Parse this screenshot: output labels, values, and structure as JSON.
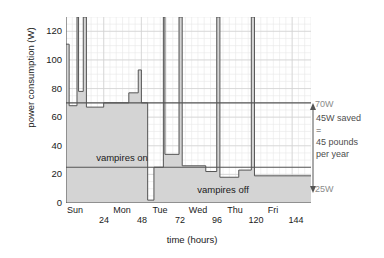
{
  "chart_data": {
    "type": "area",
    "title": "",
    "xlabel": "time (hours)",
    "ylabel": "power consumption (W)",
    "xlim": [
      0,
      156
    ],
    "ylim": [
      0,
      130
    ],
    "grid": true,
    "legend": "none",
    "yticks": [
      0,
      20,
      40,
      60,
      80,
      100,
      120
    ],
    "ytick_labels": [
      "0",
      "20",
      "40",
      "60",
      "80",
      "100",
      "120"
    ],
    "xticks": [
      0,
      24,
      48,
      72,
      96,
      120,
      144
    ],
    "xtick_labels": [
      "",
      "24",
      "48",
      "72",
      "96",
      "120",
      "144"
    ],
    "xtick_days": [
      {
        "label": "Sun",
        "x": 6
      },
      {
        "label": "Mon",
        "x": 36
      },
      {
        "label": "Tue",
        "x": 60
      },
      {
        "label": "Wed",
        "x": 84
      },
      {
        "label": "Thu",
        "x": 108
      },
      {
        "label": "Fri",
        "x": 132
      }
    ],
    "series": [
      {
        "name": "household power consumption",
        "fill_color": "#d4d4d4",
        "line_color": "#555555",
        "steps": [
          {
            "x0": 0,
            "x1": 2,
            "y": 111
          },
          {
            "x0": 2,
            "x1": 7,
            "y": 68
          },
          {
            "x0": 7,
            "x1": 8,
            "y": 130
          },
          {
            "x0": 8,
            "x1": 11,
            "y": 78
          },
          {
            "x0": 11,
            "x1": 13,
            "y": 130
          },
          {
            "x0": 13,
            "x1": 24,
            "y": 67
          },
          {
            "x0": 24,
            "x1": 40,
            "y": 70
          },
          {
            "x0": 40,
            "x1": 46,
            "y": 77
          },
          {
            "x0": 46,
            "x1": 48,
            "y": 93
          },
          {
            "x0": 48,
            "x1": 52,
            "y": 70
          },
          {
            "x0": 52,
            "x1": 56,
            "y": 2
          },
          {
            "x0": 56,
            "x1": 62,
            "y": 25
          },
          {
            "x0": 62,
            "x1": 63,
            "y": 130
          },
          {
            "x0": 63,
            "x1": 72,
            "y": 34
          },
          {
            "x0": 72,
            "x1": 74,
            "y": 130
          },
          {
            "x0": 74,
            "x1": 89,
            "y": 26
          },
          {
            "x0": 89,
            "x1": 96,
            "y": 22
          },
          {
            "x0": 96,
            "x1": 98,
            "y": 130
          },
          {
            "x0": 98,
            "x1": 110,
            "y": 18
          },
          {
            "x0": 110,
            "x1": 118,
            "y": 23
          },
          {
            "x0": 118,
            "x1": 120,
            "y": 130
          },
          {
            "x0": 120,
            "x1": 156,
            "y": 19
          }
        ]
      }
    ],
    "reference_lines": [
      {
        "name": "vampires-on-baseline",
        "value": 70,
        "label": "70W",
        "x0": 0,
        "x1": 156
      },
      {
        "name": "vampires-off-baseline",
        "value": 25,
        "label": "25W",
        "x0": 0,
        "x1": 156
      }
    ],
    "annotations": [
      {
        "name": "vampires-on",
        "text": "vampires on",
        "x": 36,
        "y": 43
      },
      {
        "name": "vampires-off",
        "text": "vampires off",
        "x": 100,
        "y": 12
      }
    ],
    "callout": {
      "top_label": "70W",
      "bottom_label": "25W",
      "lines": [
        "45W saved",
        "=",
        "45 pounds",
        "per year"
      ],
      "delta": 45
    }
  },
  "colors": {
    "fill": "#d4d4d4",
    "stroke": "#555555",
    "grid_minor": "#e8e8e8",
    "grid_major": "#d0d0d0",
    "axis": "#4d4d4d",
    "annotation": "#8c8c8c",
    "text": "#1a1a1a"
  }
}
